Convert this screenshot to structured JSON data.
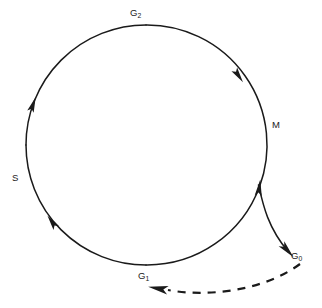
{
  "diagram": {
    "type": "cycle-diagram",
    "background_color": "#ffffff",
    "stroke_color": "#1a1a1a",
    "labels": {
      "g2": {
        "text": "G",
        "subscript": "2",
        "full": "G2"
      },
      "m": {
        "text": "M",
        "subscript": "",
        "full": "M"
      },
      "s": {
        "text": "S",
        "subscript": "",
        "full": "S"
      },
      "g1": {
        "text": "G",
        "subscript": "1",
        "full": "G1"
      },
      "g0": {
        "text": "G",
        "subscript": "0",
        "full": "G0"
      }
    },
    "cycle": {
      "center_x": 146,
      "center_y": 145,
      "radius": 120,
      "direction": "clockwise",
      "line_style": "solid",
      "arrow_count": 4
    },
    "exit_path": {
      "from": "M",
      "to": "G0",
      "line_style": "solid",
      "description": "exit from cycle to quiescent state"
    },
    "reentry_path": {
      "from": "G0",
      "to": "G1",
      "line_style": "dashed",
      "description": "re-entry from quiescent state into cycle"
    }
  }
}
